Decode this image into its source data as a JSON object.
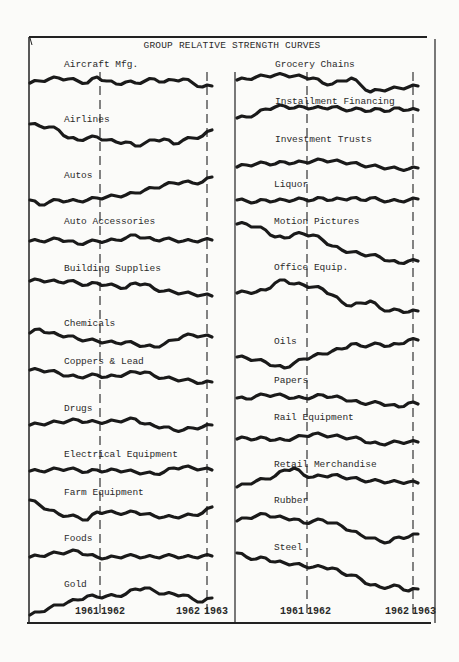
{
  "chart_data": {
    "type": "line",
    "title": "GROUP RELATIVE STRENGTH CURVES",
    "xlabel": "",
    "ylabel": "",
    "grid": false,
    "x_ticks": [
      "1961",
      "1962",
      "1962",
      "1963"
    ],
    "x_markers": [
      {
        "label_left": "1961",
        "label_right": "1962",
        "position": "start of 1962"
      },
      {
        "label_left": "1962",
        "label_right": "1963",
        "position": "start of 1963"
      }
    ],
    "note": "Values are relative vertical offsets (px, up = positive) sampled at 20 evenly spaced points across each curve; curves are untitled-axis relative strength lines.",
    "columns": [
      {
        "column": "left",
        "series": [
          {
            "name": "Aircraft Mfg.",
            "values": [
              0,
              2,
              4,
              5,
              4,
              2,
              0,
              6,
              2,
              -1,
              1,
              0,
              2,
              4,
              1,
              3,
              4,
              0,
              -4,
              -3
            ]
          },
          {
            "name": "Airlines",
            "values": [
              0,
              -2,
              -3,
              -6,
              -14,
              -16,
              -14,
              -13,
              -16,
              -18,
              -18,
              -22,
              -19,
              -16,
              -15,
              -20,
              -16,
              -14,
              -12,
              -6
            ]
          },
          {
            "name": "Autos",
            "values": [
              0,
              -5,
              -2,
              0,
              -1,
              -1,
              0,
              2,
              3,
              4,
              5,
              7,
              10,
              12,
              15,
              17,
              18,
              17,
              18,
              23
            ]
          },
          {
            "name": "Auto Accessories",
            "values": [
              0,
              0,
              1,
              2,
              0,
              -3,
              -1,
              0,
              0,
              1,
              3,
              6,
              3,
              1,
              2,
              1,
              0,
              0,
              1,
              1
            ]
          },
          {
            "name": "Building Supplies",
            "values": [
              0,
              1,
              0,
              -1,
              0,
              -2,
              -4,
              -2,
              -4,
              -5,
              -7,
              -2,
              -3,
              -8,
              -10,
              -11,
              -12,
              -13,
              -14,
              -15
            ]
          },
          {
            "name": "Chemicals",
            "values": [
              0,
              4,
              0,
              -2,
              -3,
              -6,
              -7,
              -8,
              -9,
              -10,
              -9,
              -11,
              -13,
              -14,
              -11,
              -7,
              -3,
              -2,
              -3,
              -4
            ]
          },
          {
            "name": "Coppers & Lead",
            "values": [
              0,
              0,
              -1,
              -3,
              -6,
              -7,
              -6,
              -5,
              -7,
              -6,
              -4,
              -2,
              -2,
              -6,
              -8,
              -9,
              -10,
              -11,
              -13,
              -12
            ]
          },
          {
            "name": "Drugs",
            "values": [
              0,
              1,
              2,
              3,
              4,
              5,
              3,
              3,
              3,
              4,
              5,
              6,
              1,
              -1,
              -2,
              -5,
              -5,
              -3,
              -2,
              0
            ]
          },
          {
            "name": "Electrical Equipment",
            "values": [
              0,
              0,
              1,
              2,
              2,
              1,
              -1,
              1,
              0,
              1,
              0,
              -1,
              -2,
              -3,
              -1,
              3,
              4,
              3,
              2,
              1
            ]
          },
          {
            "name": "Farm Equipment",
            "values": [
              0,
              -5,
              -10,
              -14,
              -16,
              -17,
              -20,
              -12,
              -12,
              -13,
              -13,
              -12,
              -14,
              -16,
              -17,
              -17,
              -16,
              -15,
              -13,
              -7
            ]
          },
          {
            "name": "Foods",
            "values": [
              0,
              1,
              3,
              4,
              5,
              6,
              2,
              0,
              -1,
              0,
              1,
              1,
              0,
              0,
              1,
              1,
              0,
              0,
              1,
              1
            ]
          },
          {
            "name": "Gold",
            "values": [
              0,
              3,
              7,
              10,
              13,
              15,
              19,
              18,
              19,
              19,
              21,
              26,
              27,
              24,
              21,
              21,
              20,
              16,
              13,
              17
            ]
          }
        ]
      },
      {
        "column": "right",
        "series": [
          {
            "name": "Grocery Chains",
            "values": [
              0,
              1,
              3,
              4,
              5,
              5,
              4,
              3,
              2,
              -3,
              -4,
              -1,
              2,
              -5,
              -12,
              -10,
              -9,
              -8,
              -7,
              -6
            ]
          },
          {
            "name": "Installment Financing",
            "values": [
              0,
              1,
              4,
              9,
              11,
              12,
              10,
              11,
              10,
              10,
              11,
              9,
              8,
              9,
              7,
              9,
              7,
              10,
              8,
              8
            ]
          },
          {
            "name": "Investment Trusts",
            "values": [
              0,
              2,
              3,
              4,
              3,
              5,
              4,
              5,
              6,
              7,
              6,
              5,
              4,
              2,
              1,
              0,
              -1,
              -2,
              -2,
              -1
            ]
          },
          {
            "name": "Liquor",
            "values": [
              0,
              -1,
              -2,
              0,
              -1,
              0,
              0,
              1,
              0,
              2,
              0,
              1,
              2,
              0,
              2,
              0,
              -1,
              -1,
              0,
              1
            ]
          },
          {
            "name": "Motion Pictures",
            "values": [
              0,
              0,
              -3,
              -6,
              -13,
              -14,
              -10,
              -10,
              -11,
              -16,
              -22,
              -26,
              -28,
              -30,
              -31,
              -33,
              -37,
              -39,
              -37,
              -37
            ]
          },
          {
            "name": "Office Equip.",
            "values": [
              0,
              1,
              1,
              3,
              10,
              13,
              9,
              8,
              6,
              4,
              -2,
              -9,
              -13,
              -10,
              -8,
              -15,
              -18,
              -17,
              -19,
              -18
            ]
          },
          {
            "name": "Oils",
            "values": [
              0,
              -1,
              -3,
              -5,
              -9,
              -11,
              -6,
              -2,
              1,
              3,
              6,
              8,
              13,
              11,
              12,
              13,
              11,
              13,
              17,
              17
            ]
          },
          {
            "name": "Papers",
            "values": [
              0,
              -1,
              2,
              3,
              3,
              2,
              0,
              0,
              1,
              3,
              1,
              0,
              -3,
              -5,
              -5,
              -5,
              -7,
              -9,
              -5,
              -6
            ]
          },
          {
            "name": "Rail Equipment",
            "values": [
              0,
              1,
              0,
              1,
              -1,
              -1,
              1,
              3,
              5,
              4,
              3,
              2,
              1,
              0,
              -4,
              -5,
              -4,
              -3,
              -3,
              -3
            ]
          },
          {
            "name": "Retail Merchandise",
            "values": [
              0,
              3,
              6,
              8,
              11,
              17,
              19,
              12,
              10,
              11,
              12,
              10,
              9,
              7,
              6,
              6,
              5,
              5,
              5,
              4
            ]
          },
          {
            "name": "Rubber",
            "values": [
              0,
              3,
              5,
              7,
              4,
              3,
              2,
              -2,
              0,
              1,
              -2,
              -5,
              -10,
              -14,
              -17,
              -20,
              -21,
              -16,
              -16,
              -13
            ]
          },
          {
            "name": "Steel",
            "values": [
              0,
              -4,
              -6,
              -5,
              -9,
              -10,
              -11,
              -13,
              -14,
              -14,
              -15,
              -20,
              -22,
              -26,
              -32,
              -34,
              -34,
              -33,
              -38,
              -36
            ]
          }
        ]
      }
    ],
    "x_axis_labels": {
      "left": [
        "1961",
        "1962",
        "1962",
        "1963"
      ],
      "right": [
        "1961",
        "1962",
        "1962",
        "1963"
      ]
    }
  },
  "title": "GROUP RELATIVE STRENGTH CURVES",
  "left_labels": [
    "Aircraft Mfg.",
    "Airlines",
    "Autos",
    "Auto Accessories",
    "Building Supplies",
    "Chemicals",
    "Coppers & Lead",
    "Drugs",
    "Electrical Equipment",
    "Farm Equipment",
    "Foods",
    "Gold"
  ],
  "right_labels": [
    "Grocery Chains",
    "Installment Financing",
    "Investment Trusts",
    "Liquor",
    "Motion Pictures",
    "Office Equip.",
    "Oils",
    "Papers",
    "Rail Equipment",
    "Retail Merchandise",
    "Rubber",
    "Steel"
  ],
  "axis": {
    "left": {
      "y1961": "1961",
      "y1962a": "1962",
      "y1962b": "1962",
      "y1963": "1963"
    },
    "right": {
      "y1961": "1961",
      "y1962a": "1962",
      "y1962b": "1962",
      "y1963": "1963"
    }
  }
}
